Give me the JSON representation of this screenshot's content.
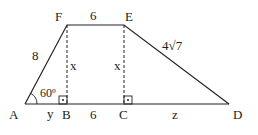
{
  "diagram": {
    "type": "trapezoid",
    "points": {
      "A": "A",
      "B": "B",
      "C": "C",
      "D": "D",
      "E": "E",
      "F": "F"
    },
    "labels": {
      "side_AF": "8",
      "side_FE": "6",
      "side_ED": "4√7",
      "side_BC": "6",
      "segment_AB": "y",
      "segment_CD": "z",
      "height_FB": "x",
      "height_EC": "x",
      "angle_A": "60º"
    }
  }
}
